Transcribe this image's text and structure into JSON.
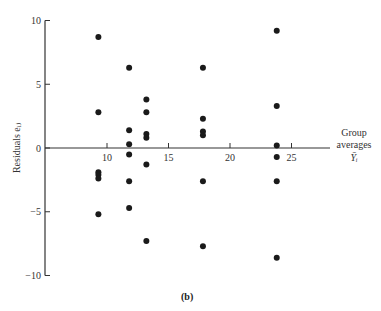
{
  "chart_data": {
    "type": "scatter",
    "title": "",
    "caption": "(b)",
    "xlabel": [
      "Group",
      "averages",
      "Ȳᵢ"
    ],
    "ylabel": "Residuals eᵢⱼ",
    "xlim": [
      5,
      28
    ],
    "ylim": [
      -10,
      10
    ],
    "x_ticks": [
      10,
      15,
      20,
      25
    ],
    "y_ticks": [
      10,
      5,
      0,
      -5,
      -10
    ],
    "x_tick_labels": [
      "10",
      "15",
      "20",
      "25"
    ],
    "y_tick_labels": [
      "10",
      "5",
      "0",
      "−5",
      "−10"
    ],
    "grid": false,
    "legend": null,
    "series": [
      {
        "name": "Group 1",
        "x": 9.3,
        "values": [
          8.7,
          2.8,
          -1.9,
          -2.1,
          -2.4,
          -5.2
        ]
      },
      {
        "name": "Group 2",
        "x": 11.8,
        "values": [
          6.3,
          1.4,
          0.3,
          -0.5,
          -2.6,
          -4.7
        ]
      },
      {
        "name": "Group 3",
        "x": 13.2,
        "values": [
          3.8,
          2.8,
          1.1,
          0.8,
          -1.3,
          -7.3
        ]
      },
      {
        "name": "Group 4",
        "x": 17.8,
        "values": [
          6.3,
          2.3,
          1.3,
          1.0,
          -2.6,
          -7.7
        ]
      },
      {
        "name": "Group 5",
        "x": 23.8,
        "values": [
          9.2,
          3.3,
          0.2,
          -0.7,
          -2.6,
          -8.6
        ]
      }
    ],
    "colors": {
      "points": "#1a1a1a",
      "axes": "#333333"
    }
  }
}
